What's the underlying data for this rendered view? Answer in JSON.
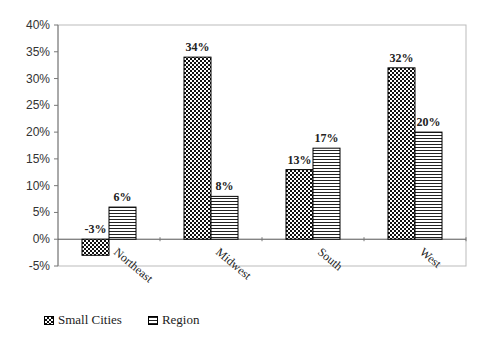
{
  "chart_data": {
    "type": "bar",
    "title": "",
    "xlabel": "",
    "ylabel": "",
    "categories": [
      "Northeast",
      "Midwest",
      "South",
      "West"
    ],
    "series": [
      {
        "name": "Small Cities",
        "pattern": "checkerboard",
        "values": [
          -3,
          34,
          13,
          32
        ],
        "labels": [
          "-3%",
          "34%",
          "13%",
          "32%"
        ]
      },
      {
        "name": "Region",
        "pattern": "horizontal-stripes",
        "values": [
          6,
          8,
          17,
          20
        ],
        "labels": [
          "6%",
          "8%",
          "17%",
          "20%"
        ]
      }
    ],
    "ylim": [
      -5,
      40
    ],
    "yticks": [
      40,
      35,
      30,
      25,
      20,
      15,
      10,
      5,
      0,
      -5
    ],
    "ytick_labels": [
      "40%",
      "35%",
      "30%",
      "25%",
      "20%",
      "15%",
      "10%",
      "5%",
      "0%",
      "-5%"
    ],
    "grid": false,
    "legend": "bottom-left"
  },
  "legend": {
    "items": [
      {
        "label": "Small Cities",
        "icon": "checkerboard-swatch"
      },
      {
        "label": "Region",
        "icon": "stripes-swatch"
      }
    ]
  }
}
